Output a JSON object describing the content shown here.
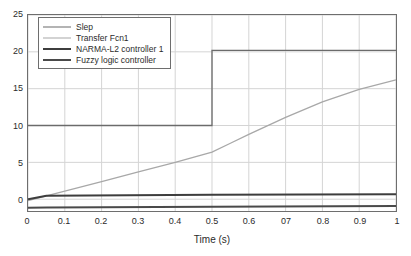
{
  "chart_data": {
    "type": "line",
    "title": "",
    "xlabel": "Time (s)",
    "ylabel": "",
    "xlim": [
      0,
      1
    ],
    "ylim": [
      -1.6,
      25
    ],
    "grid": true,
    "legend_position": "upper-left-inside",
    "xticks": [
      0,
      0.1,
      0.2,
      0.3,
      0.4,
      0.5,
      0.6,
      0.7,
      0.8,
      0.9,
      1
    ],
    "xtick_labels": [
      "0",
      "0.1",
      "0.2",
      "0.3",
      "0.4",
      "0.5",
      "0.6",
      "07",
      "0.8",
      "0.9",
      "1"
    ],
    "yticks": [
      0,
      5,
      10,
      15,
      20,
      25
    ],
    "ytick_labels": [
      "0",
      "5",
      "10",
      "15",
      "20",
      "25"
    ],
    "series": [
      {
        "name": "Slep",
        "color": "#6b6b6b",
        "width": 1.3,
        "x": [
          0,
          0.5,
          0.5,
          1
        ],
        "values": [
          10,
          10,
          20.2,
          20.2
        ]
      },
      {
        "name": "Transfer Fcn1",
        "color": "#a8a8a8",
        "width": 1.3,
        "x": [
          0,
          0.05,
          0.1,
          0.2,
          0.3,
          0.4,
          0.5,
          0.55,
          0.6,
          0.7,
          0.8,
          0.9,
          1
        ],
        "values": [
          -0.2,
          0.45,
          1.1,
          2.4,
          3.7,
          5.0,
          6.4,
          7.6,
          8.8,
          11.1,
          13.2,
          14.9,
          16.2
        ]
      },
      {
        "name": "NARMA-L2 controller 1",
        "color": "#3d3d3d",
        "width": 2.0,
        "x": [
          0,
          0.05,
          0.5,
          1
        ],
        "values": [
          0.0,
          0.48,
          0.6,
          0.68
        ]
      },
      {
        "name": "Fuzzy logic controller",
        "color": "#4a4a4a",
        "width": 2.0,
        "x": [
          0,
          0.05,
          0.5,
          1
        ],
        "values": [
          -1.15,
          -1.12,
          -1.02,
          -0.92
        ]
      }
    ]
  },
  "axes": {
    "frame_color": "#6e6e6e",
    "grid_color": "#d4d4d4",
    "background": "#ffffff"
  }
}
